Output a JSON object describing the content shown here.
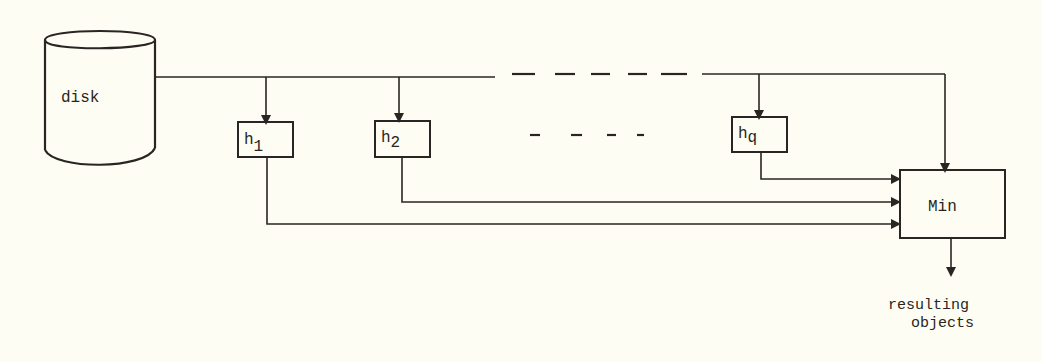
{
  "diagram": {
    "colors": {
      "background": "#fefdf3",
      "ink": "#2a2522"
    },
    "nodes": {
      "disk": {
        "label": "disk"
      },
      "h1": {
        "base": "h",
        "sub": "1"
      },
      "h2": {
        "base": "h",
        "sub": "2"
      },
      "hq": {
        "base": "h",
        "sub": "q"
      },
      "min": {
        "label": "Min"
      }
    },
    "ellipsis_between_h2_hq": "- - - -",
    "output": {
      "line1": "resulting",
      "line2": "objects"
    },
    "edges": [
      {
        "from": "disk",
        "to": "h1"
      },
      {
        "from": "disk",
        "to": "h2"
      },
      {
        "from": "disk",
        "to": "hq"
      },
      {
        "from": "disk",
        "to": "min"
      },
      {
        "from": "h1",
        "to": "min"
      },
      {
        "from": "h2",
        "to": "min"
      },
      {
        "from": "hq",
        "to": "min"
      },
      {
        "from": "min",
        "to": "resulting objects"
      }
    ]
  }
}
